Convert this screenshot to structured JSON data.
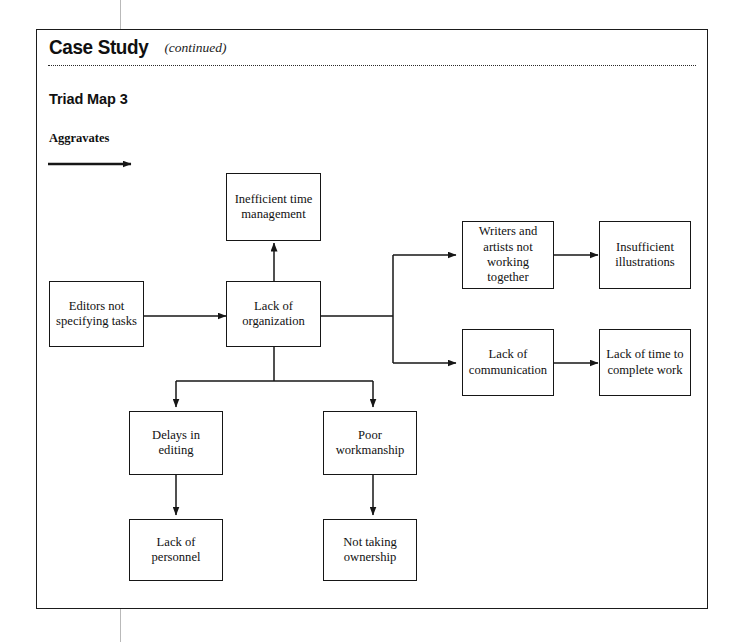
{
  "header": {
    "title": "Case Study",
    "title_suffix": "(continued)"
  },
  "section": {
    "title": "Triad Map 3",
    "legend_label": "Aggravates",
    "legend_icon": "right-arrow-icon"
  },
  "diagram": {
    "type": "flowchart",
    "relation": "Aggravates",
    "nodes": [
      {
        "id": "editors",
        "label": "Editors not specifying tasks"
      },
      {
        "id": "inefficient",
        "label": "Inefficient time management"
      },
      {
        "id": "organization",
        "label": "Lack of organization"
      },
      {
        "id": "writers",
        "label": "Writers and artists not working together"
      },
      {
        "id": "illustrations",
        "label": "Insufficient illustrations"
      },
      {
        "id": "communication",
        "label": "Lack of communication"
      },
      {
        "id": "time",
        "label": "Lack of time to complete work"
      },
      {
        "id": "delays",
        "label": "Delays in editing"
      },
      {
        "id": "workmanship",
        "label": "Poor workmanship"
      },
      {
        "id": "personnel",
        "label": "Lack of personnel"
      },
      {
        "id": "ownership",
        "label": "Not taking ownership"
      }
    ],
    "edges": [
      {
        "from": "editors",
        "to": "organization"
      },
      {
        "from": "organization",
        "to": "inefficient"
      },
      {
        "from": "organization",
        "to": "writers"
      },
      {
        "from": "organization",
        "to": "communication"
      },
      {
        "from": "organization",
        "to": "delays"
      },
      {
        "from": "organization",
        "to": "workmanship"
      },
      {
        "from": "writers",
        "to": "illustrations"
      },
      {
        "from": "communication",
        "to": "time"
      },
      {
        "from": "delays",
        "to": "personnel"
      },
      {
        "from": "workmanship",
        "to": "ownership"
      }
    ]
  },
  "colors": {
    "ink": "#161616",
    "page": "#ffffff"
  }
}
